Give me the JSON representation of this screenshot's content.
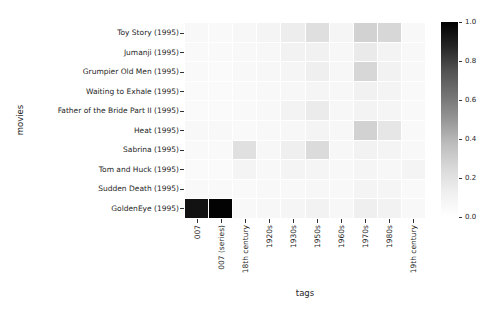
{
  "figure": {
    "background": "#ffffff",
    "text_color": "#262626",
    "xlabel": "tags",
    "ylabel": "movies"
  },
  "chart_data": {
    "type": "heatmap",
    "title": "",
    "xlabel": "tags",
    "ylabel": "movies",
    "rows": [
      "Toy Story (1995)",
      "Jumanji (1995)",
      "Grumpier Old Men (1995)",
      "Waiting to Exhale (1995)",
      "Father of the Bride Part II (1995)",
      "Heat (1995)",
      "Sabrina (1995)",
      "Tom and Huck (1995)",
      "Sudden Death (1995)",
      "GoldenEye (1995)"
    ],
    "cols": [
      "007",
      "007 (series)",
      "18th century",
      "1920s",
      "1930s",
      "1950s",
      "1960s",
      "1970s",
      "1980s",
      "19th century"
    ],
    "values": [
      [
        0.06,
        0.05,
        0.07,
        0.09,
        0.14,
        0.22,
        0.08,
        0.28,
        0.26,
        0.06
      ],
      [
        0.05,
        0.05,
        0.06,
        0.07,
        0.11,
        0.12,
        0.07,
        0.16,
        0.1,
        0.06
      ],
      [
        0.05,
        0.04,
        0.06,
        0.07,
        0.08,
        0.13,
        0.07,
        0.26,
        0.11,
        0.06
      ],
      [
        0.04,
        0.04,
        0.05,
        0.06,
        0.07,
        0.08,
        0.07,
        0.12,
        0.09,
        0.05
      ],
      [
        0.04,
        0.04,
        0.05,
        0.06,
        0.1,
        0.15,
        0.07,
        0.1,
        0.08,
        0.05
      ],
      [
        0.06,
        0.06,
        0.05,
        0.06,
        0.07,
        0.09,
        0.07,
        0.28,
        0.18,
        0.05
      ],
      [
        0.05,
        0.05,
        0.21,
        0.07,
        0.13,
        0.24,
        0.07,
        0.11,
        0.09,
        0.06
      ],
      [
        0.04,
        0.04,
        0.09,
        0.06,
        0.09,
        0.08,
        0.06,
        0.08,
        0.07,
        0.09
      ],
      [
        0.05,
        0.05,
        0.05,
        0.06,
        0.06,
        0.07,
        0.06,
        0.09,
        0.08,
        0.05
      ],
      [
        0.94,
        0.99,
        0.06,
        0.07,
        0.08,
        0.11,
        0.07,
        0.13,
        0.11,
        0.06
      ]
    ],
    "vmin": 0.0,
    "vmax": 1.0,
    "colormap": "Greys",
    "colormap_stops": [
      [
        0.0,
        "#ffffff"
      ],
      [
        0.125,
        "#f0f0f0"
      ],
      [
        0.25,
        "#d9d9d9"
      ],
      [
        0.375,
        "#bdbdbd"
      ],
      [
        0.5,
        "#969696"
      ],
      [
        0.625,
        "#737373"
      ],
      [
        0.75,
        "#525252"
      ],
      [
        0.875,
        "#252525"
      ],
      [
        1.0,
        "#000000"
      ]
    ],
    "colorbar_ticks": [
      {
        "value": 0.0,
        "label": "0.0"
      },
      {
        "value": 0.2,
        "label": "0.2"
      },
      {
        "value": 0.4,
        "label": "0.4"
      },
      {
        "value": 0.6,
        "label": "0.6"
      },
      {
        "value": 0.8,
        "label": "0.8"
      },
      {
        "value": 1.0,
        "label": "1.0"
      }
    ],
    "grid": "1px white separators between cells",
    "legend_position": "colorbar-right"
  }
}
